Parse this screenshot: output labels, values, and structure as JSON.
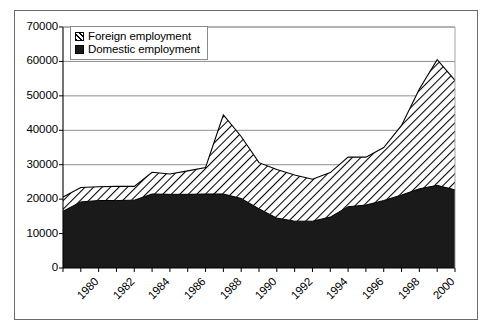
{
  "chart_data": {
    "type": "area",
    "stacked": true,
    "title": "",
    "subtitle": "",
    "xlabel": "",
    "ylabel": "",
    "grid": true,
    "legend_position": "top-left",
    "xlim": [
      1980,
      2002
    ],
    "ylim": [
      0,
      70000
    ],
    "ytick_values": [
      0,
      10000,
      20000,
      30000,
      40000,
      50000,
      60000,
      70000
    ],
    "ytick_labels": [
      "0",
      "10000",
      "20000",
      "30000",
      "40000",
      "50000",
      "60000",
      "70000"
    ],
    "xtick_labels": [
      "1980",
      "1982",
      "1984",
      "1986",
      "1988",
      "1990",
      "1992",
      "1994",
      "1996",
      "1998",
      "2000"
    ],
    "xtick_values": [
      1980,
      1982,
      1984,
      1986,
      1988,
      1990,
      1992,
      1994,
      1996,
      1998,
      2000
    ],
    "x": [
      1980,
      1981,
      1982,
      1983,
      1984,
      1985,
      1986,
      1987,
      1988,
      1989,
      1990,
      1991,
      1992,
      1993,
      1994,
      1995,
      1996,
      1997,
      1998,
      1999,
      2000,
      2001,
      2002
    ],
    "series": [
      {
        "name": "Domestic employment",
        "fill": "solid-black",
        "color": "#1a1a1a",
        "values": [
          16500,
          19200,
          19600,
          19600,
          19700,
          21500,
          21400,
          21400,
          21500,
          21500,
          20200,
          17200,
          14500,
          13600,
          13600,
          14800,
          17800,
          18300,
          19600,
          21200,
          23000,
          24000,
          22700
        ]
      },
      {
        "name": "Foreign employment",
        "fill": "diagonal-hatch",
        "color": "#ffffff",
        "values": [
          4100,
          4200,
          4000,
          4100,
          4000,
          6300,
          5900,
          6800,
          7700,
          23000,
          18000,
          13400,
          14100,
          13400,
          12200,
          12900,
          14400,
          13900,
          15400,
          20200,
          29000,
          36500,
          31800
        ]
      }
    ],
    "totals": [
      20600,
      23400,
      23600,
      23700,
      23700,
      27800,
      27300,
      28200,
      29200,
      44500,
      38200,
      30600,
      28600,
      27000,
      25800,
      27700,
      32200,
      32200,
      35000,
      41400,
      52000,
      60500,
      54500
    ]
  },
  "legend": {
    "items": [
      {
        "label": "Foreign employment",
        "swatch": "hatch-swatch"
      },
      {
        "label": "Domestic employment",
        "swatch": "solid-swatch"
      }
    ]
  },
  "colors": {
    "frame": "#6b6b6b",
    "axis": "#000000",
    "gridline": "#808080",
    "domestic": "#1a1a1a",
    "foreign_hatch": "#000000",
    "background": "#ffffff"
  }
}
